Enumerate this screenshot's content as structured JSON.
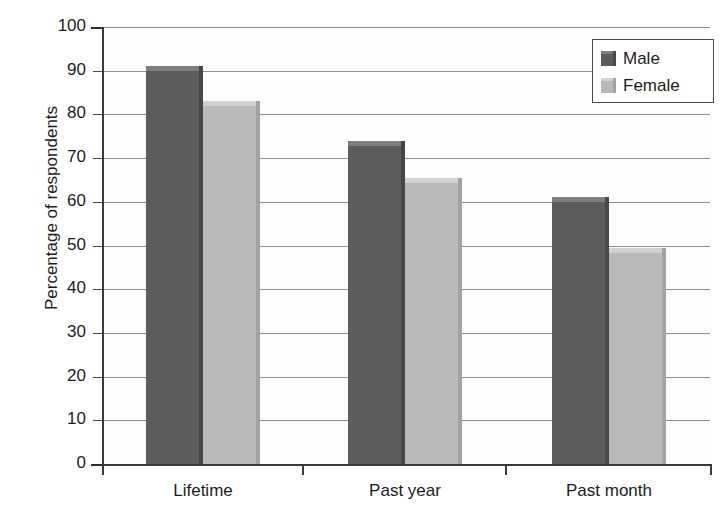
{
  "chart_data": {
    "type": "bar",
    "title": "",
    "subtitle": "",
    "xlabel": "",
    "ylabel": "Percentage of respondents",
    "categories": [
      "Lifetime",
      "Past year",
      "Past month"
    ],
    "series": [
      {
        "name": "Male",
        "values": [
          91,
          74,
          61
        ],
        "color": "#5c5c5c"
      },
      {
        "name": "Female",
        "values": [
          83,
          65.5,
          49.5
        ],
        "color": "#b9b9b9"
      }
    ],
    "ylim": [
      0,
      100
    ],
    "ytick_step": 10,
    "yticks": [
      0,
      10,
      20,
      30,
      40,
      50,
      60,
      70,
      80,
      90,
      100
    ],
    "ytick_labels": [
      "0",
      "10",
      "20",
      "30",
      "40",
      "50",
      "60",
      "70",
      "80",
      "90",
      "100"
    ],
    "grid": true,
    "grid_axis": "y",
    "legend": {
      "position": "top-right",
      "boxed": true,
      "entries": [
        "Male",
        "Female"
      ]
    },
    "style": "grayscale-3d-bars"
  },
  "colors": {
    "male": "#5c5c5c",
    "male_top": "#7e7e7e",
    "male_right": "#474747",
    "female": "#b9b9b9",
    "female_top": "#d2d2d2",
    "female_right": "#a2a2a2",
    "grid": "#8d8d8d",
    "axis": "#3a3a3a",
    "text": "#1c1c1c",
    "background": "#ffffff"
  }
}
